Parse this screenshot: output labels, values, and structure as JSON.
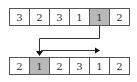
{
  "diagram": {
    "top_row": {
      "cells": [
        "3",
        "2",
        "3",
        "1",
        "1",
        "2"
      ],
      "highlighted_index": 4
    },
    "bottom_row": {
      "cells": [
        "2",
        "1",
        "2",
        "3",
        "1",
        "2"
      ],
      "highlighted_index": 1
    },
    "arrows": [
      {
        "from": "top_row.cell_4",
        "to": "bottom_row.cell_1",
        "meaning": "move element"
      },
      {
        "from": "bottom_row.cell_1",
        "to": "bottom_row.cell_4",
        "meaning": "shift right"
      }
    ],
    "colors": {
      "highlight": "#b8b8b8",
      "border": "#555555",
      "line": "#333333"
    }
  }
}
